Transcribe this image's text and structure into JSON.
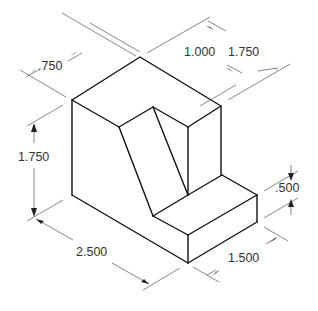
{
  "drawing": {
    "type": "isometric-dimensioned-part",
    "colors": {
      "object_line": "#111111",
      "dimension_line": "#555555",
      "text": "#333333"
    },
    "dimensions": {
      "top_left_depth": ".750",
      "top_slot_width": "1.000",
      "top_right_depth": "1.750",
      "overall_height": "1.750",
      "overall_length": "2.500",
      "step_height": ".500",
      "step_width": "1.500"
    }
  }
}
